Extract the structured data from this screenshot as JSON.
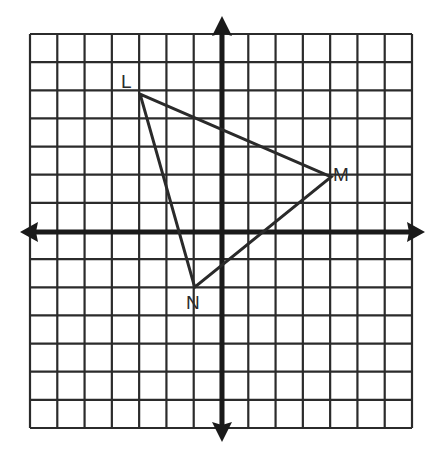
{
  "figure": {
    "type": "coordinate-plane-triangle",
    "grid": {
      "columns": 14,
      "rows": 14,
      "x_range": [
        -7,
        7
      ],
      "y_range": [
        -7,
        7
      ],
      "line_color": "#2b2b2b"
    },
    "axes": {
      "color": "#1a1a1a",
      "arrows": true
    },
    "triangle": {
      "vertices": [
        {
          "label": "L",
          "x": -3,
          "y": 5
        },
        {
          "label": "M",
          "x": 4,
          "y": 2
        },
        {
          "label": "N",
          "x": -1,
          "y": -2
        }
      ],
      "stroke": "#2a2a2a"
    }
  },
  "labels": {
    "L": "L",
    "M": "M",
    "N": "N"
  }
}
